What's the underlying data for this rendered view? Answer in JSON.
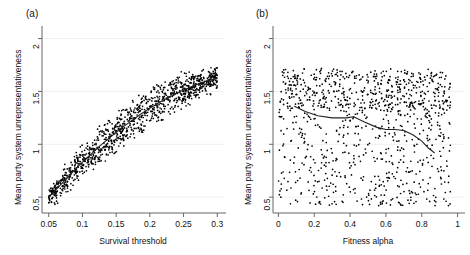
{
  "figure": {
    "background": "#ffffff",
    "ink": "#111111",
    "gridline_color": "#f0f0f0",
    "axis_color": "#666666",
    "point_color": "#000000",
    "curve_color": "#222222"
  },
  "panels": [
    {
      "key": "a",
      "label": "(a)",
      "xlabel": "Survival threshold",
      "ylabel": "Mean party system unrepresentativeness",
      "xticks": [
        "0.05",
        "0.1",
        "0.15",
        "0.2",
        "0.25",
        "0.3"
      ],
      "xtick_values": [
        0.05,
        0.1,
        0.15,
        0.2,
        0.25,
        0.3
      ],
      "yticks": [
        "0.5",
        "1",
        "1.5",
        "2"
      ],
      "ytick_values": [
        0.5,
        1,
        1.5,
        2
      ],
      "xlim": [
        0.04,
        0.31
      ],
      "ylim": [
        0.35,
        2.1
      ],
      "gridlines": true
    },
    {
      "key": "b",
      "label": "(b)",
      "xlabel": "Fitness alpha",
      "ylabel": "Mean party system unrepresentativeness",
      "xticks": [
        "0",
        "0.2",
        "0.4",
        "0.6",
        "0.8",
        "1"
      ],
      "xtick_values": [
        0,
        0.2,
        0.4,
        0.6,
        0.8,
        1
      ],
      "yticks": [
        "0.5",
        "1",
        "1.5",
        "2"
      ],
      "ytick_values": [
        0.5,
        1,
        1.5,
        2
      ],
      "xlim": [
        -0.03,
        1.03
      ],
      "ylim": [
        0.35,
        2.1
      ],
      "gridlines": true
    }
  ],
  "chart_data": [
    {
      "type": "scatter",
      "panel": "a",
      "title": "(a)",
      "xlabel": "Survival threshold",
      "ylabel": "Mean party system unrepresentativeness",
      "xlim": [
        0.04,
        0.31
      ],
      "ylim": [
        0.35,
        2.1
      ],
      "xticks": [
        0.05,
        0.1,
        0.15,
        0.2,
        0.25,
        0.3
      ],
      "yticks": [
        0.5,
        1,
        1.5,
        2
      ],
      "grid": true,
      "legend": "none",
      "description": "Dense point cloud rising monotonically and concavely from about (0.05, 0.48) to about (0.30, 1.62); vertical spread about +/-0.15 around the trend, widest near x=0.20. A lowess trend line runs through the middle of the cloud.",
      "trend": {
        "name": "lowess",
        "x": [
          0.05,
          0.065,
          0.08,
          0.095,
          0.11,
          0.125,
          0.14,
          0.155,
          0.17,
          0.185,
          0.2,
          0.215,
          0.23,
          0.245,
          0.26,
          0.275,
          0.29,
          0.3
        ],
        "y": [
          0.5,
          0.6,
          0.7,
          0.8,
          0.89,
          0.98,
          1.06,
          1.14,
          1.21,
          1.28,
          1.34,
          1.4,
          1.45,
          1.5,
          1.54,
          1.58,
          1.61,
          1.62
        ]
      },
      "scatter_band": {
        "n_points": 1100,
        "x_range": [
          0.05,
          0.3
        ],
        "spread_y": 0.16
      }
    },
    {
      "type": "scatter",
      "panel": "b",
      "title": "(b)",
      "xlabel": "Fitness alpha",
      "ylabel": "Mean party system unrepresentativeness",
      "xlim": [
        -0.03,
        1.03
      ],
      "ylim": [
        0.35,
        2.1
      ],
      "xticks": [
        0,
        0.2,
        0.4,
        0.6,
        0.8,
        1
      ],
      "yticks": [
        0.5,
        1,
        1.5,
        2
      ],
      "grid": true,
      "legend": "none",
      "description": "Broad, nearly uniform cloud of points filling y from about 0.42 to 1.72 across the whole x range 0 to 0.95, slightly denser in the upper band near y=1.5-1.7. A lowess line drifts gently downward from about 1.36 at x=0.09 to about 0.92 at x=0.87.",
      "trend": {
        "name": "lowess",
        "x": [
          0.09,
          0.15,
          0.22,
          0.3,
          0.38,
          0.42,
          0.48,
          0.55,
          0.6,
          0.65,
          0.7,
          0.75,
          0.8,
          0.84,
          0.87
        ],
        "y": [
          1.36,
          1.31,
          1.27,
          1.25,
          1.25,
          1.26,
          1.21,
          1.16,
          1.14,
          1.14,
          1.13,
          1.09,
          1.03,
          0.96,
          0.92
        ]
      },
      "scatter_band": {
        "n_points": 1000,
        "x_range": [
          0.0,
          0.96
        ],
        "y_range": [
          0.42,
          1.72
        ]
      }
    }
  ]
}
